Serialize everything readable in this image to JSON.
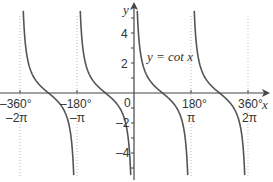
{
  "chart_data": {
    "type": "line",
    "title": "",
    "function_label": "y = cot x",
    "xlabel": "x",
    "ylabel": "y",
    "xlim": [
      -380,
      390
    ],
    "ylim": [
      -5.4,
      6.0
    ],
    "x_ticks_deg": [
      "-360°",
      "-180°",
      "0",
      "180°",
      "360°"
    ],
    "x_ticks_rad": [
      "-2π",
      "-π",
      "",
      "π",
      "2π"
    ],
    "x_tick_values": [
      -360,
      -180,
      0,
      180,
      360
    ],
    "y_ticks": [
      -4,
      -2,
      2,
      4
    ],
    "y_minor_ticks": [
      -5,
      -4,
      -3,
      -2,
      -1,
      1,
      2,
      3,
      4,
      5
    ],
    "asymptotes": [
      -360,
      -180,
      0,
      180,
      360
    ],
    "grid": "dotted vertical at asymptotes",
    "series": [
      {
        "name": "cot x",
        "branches": [
          [
            -360,
            -180
          ],
          [
            -180,
            0
          ],
          [
            0,
            180
          ],
          [
            180,
            360
          ]
        ]
      }
    ],
    "colors": {
      "curve": "#555555",
      "axis": "#444444",
      "grid": "#bbbbbb"
    }
  },
  "labels": {
    "y_axis": "y",
    "x_axis": "x",
    "origin": "0",
    "func": "y = cot x",
    "xdeg": [
      "–360°",
      "–180°",
      "180°",
      "360°"
    ],
    "xrad": [
      "–2π",
      "–π",
      "π",
      "2π"
    ],
    "y": [
      "4",
      "2",
      "–2",
      "–4"
    ]
  }
}
